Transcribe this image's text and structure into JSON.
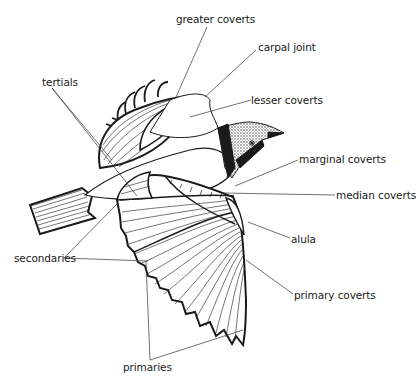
{
  "diagram": {
    "labels": {
      "greater_coverts": "greater coverts",
      "carpal_joint": "carpal joint",
      "lesser_coverts": "lesser coverts",
      "tertials": "tertials",
      "marginal_coverts": "marginal coverts",
      "median_coverts": "median coverts",
      "alula": "alula",
      "secondaries": "secondaries",
      "primary_coverts": "primary coverts",
      "primaries": "primaries"
    },
    "colors": {
      "ink": "#1a1a1a",
      "background": "#ffffff"
    }
  }
}
